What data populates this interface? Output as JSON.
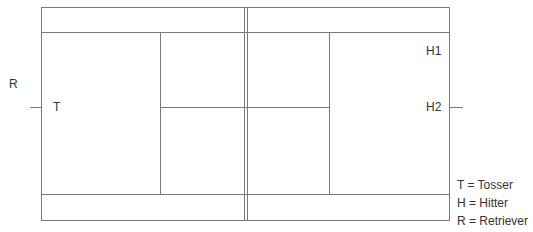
{
  "diagram": {
    "labels": {
      "r": "R",
      "t": "T",
      "h1": "H1",
      "h2": "H2"
    },
    "legend": [
      "T = Tosser",
      "H = Hitter",
      "R = Retriever"
    ],
    "line_color": "#7a7a7a"
  }
}
